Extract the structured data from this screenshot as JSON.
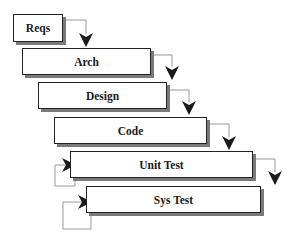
{
  "diagram": {
    "colors": {
      "border": "#222222",
      "shadow": "#7a7a7a",
      "connector": "#999999",
      "arrowhead": "#1a1a1a"
    },
    "stages": [
      {
        "id": "reqs",
        "label": "Reqs",
        "x": 13,
        "y": 14,
        "w": 50,
        "h": 28
      },
      {
        "id": "arch",
        "label": "Arch",
        "x": 22,
        "y": 48,
        "w": 129,
        "h": 27
      },
      {
        "id": "design",
        "label": "Design",
        "x": 38,
        "y": 82,
        "w": 129,
        "h": 27
      },
      {
        "id": "code",
        "label": "Code",
        "x": 54,
        "y": 117,
        "w": 153,
        "h": 27
      },
      {
        "id": "unit",
        "label": "Unit Test",
        "x": 70,
        "y": 151,
        "w": 183,
        "h": 27
      },
      {
        "id": "sys",
        "label": "Sys Test",
        "x": 86,
        "y": 186,
        "w": 175,
        "h": 27
      }
    ],
    "edges": [
      {
        "from": "reqs",
        "to": "arch",
        "type": "down-right"
      },
      {
        "from": "arch",
        "to": "design",
        "type": "down-right"
      },
      {
        "from": "design",
        "to": "code",
        "type": "down-right"
      },
      {
        "from": "code",
        "to": "unit",
        "type": "down-right"
      },
      {
        "from": "unit",
        "to": "sys",
        "type": "down-right"
      },
      {
        "from": "unit",
        "to": "unit",
        "type": "self-loop"
      },
      {
        "from": "sys",
        "to": "sys",
        "type": "self-loop"
      }
    ]
  }
}
